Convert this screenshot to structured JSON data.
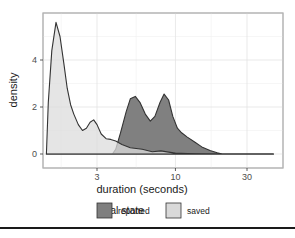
{
  "chart_data": {
    "type": "area",
    "subtype": "density",
    "xlabel": "duration (seconds)",
    "ylabel": "density",
    "x_scale": "log10",
    "x_ticks": [
      3,
      10,
      30
    ],
    "y_ticks": [
      0,
      2,
      4
    ],
    "xlim": [
      1.1,
      50
    ],
    "ylim": [
      -0.2,
      6.0
    ],
    "grid": true,
    "legend": {
      "title": "final state",
      "position": "bottom",
      "entries": [
        {
          "label": "reported",
          "color": "#7f7f7f"
        },
        {
          "label": "saved",
          "color": "#d9d9d9"
        }
      ]
    },
    "series": [
      {
        "name": "saved",
        "color": "#dcdcdc",
        "x": [
          1.38,
          1.42,
          1.5,
          1.6,
          1.7,
          1.8,
          1.9,
          2.0,
          2.1,
          2.25,
          2.4,
          2.55,
          2.7,
          2.85,
          3.0,
          3.2,
          3.45,
          3.7,
          4.0,
          4.4,
          5.0,
          6.0,
          7.0,
          8.0,
          9.0,
          10.0,
          12.0,
          15.0,
          20.0,
          30.0,
          45.0
        ],
        "values": [
          0,
          2.2,
          4.4,
          5.6,
          5.0,
          3.9,
          2.8,
          2.1,
          1.7,
          1.25,
          1.0,
          1.1,
          1.35,
          1.45,
          1.25,
          0.85,
          0.65,
          0.62,
          0.55,
          0.4,
          0.27,
          0.2,
          0.1,
          0.13,
          0.08,
          0.04,
          0.02,
          0.01,
          0.0,
          0.0,
          0.0
        ]
      },
      {
        "name": "reported",
        "color": "#808080",
        "x": [
          1.38,
          3.8,
          4.0,
          4.3,
          4.7,
          5.0,
          5.4,
          5.8,
          6.3,
          6.8,
          7.3,
          7.9,
          8.4,
          9.0,
          9.6,
          10.3,
          11.0,
          12.0,
          13.5,
          15.0,
          17.0,
          19.0,
          20.5,
          30.0,
          45.0
        ],
        "values": [
          0,
          0,
          0.2,
          0.9,
          1.8,
          2.35,
          2.45,
          2.2,
          1.7,
          1.4,
          1.6,
          2.2,
          2.55,
          2.3,
          1.6,
          1.1,
          0.9,
          0.72,
          0.5,
          0.3,
          0.15,
          0.05,
          0.0,
          0.0,
          0.0
        ]
      }
    ]
  }
}
